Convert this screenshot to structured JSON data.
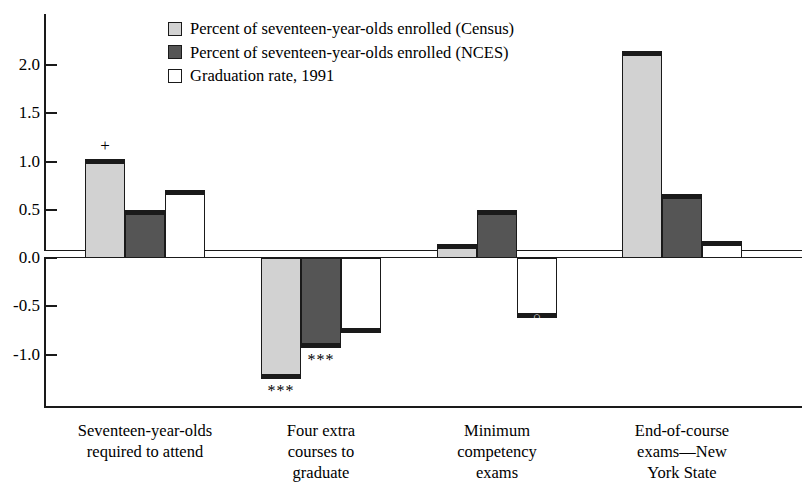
{
  "chart_data": {
    "type": "bar",
    "title": "",
    "xlabel": "",
    "ylabel": "",
    "ylim": [
      -1.45,
      2.35
    ],
    "yticks": [
      "2.0",
      "1.5",
      "1.0",
      "0.5",
      "0.0",
      "-0.5",
      "-1.0"
    ],
    "ytick_values": [
      2.0,
      1.5,
      1.0,
      0.5,
      0.0,
      -0.5,
      -1.0
    ],
    "grid": false,
    "legend_position": "top-center",
    "categories": [
      "Seventeen-year-olds\nrequired to attend",
      "Four extra\ncourses to\ngraduate",
      "Minimum\ncompetency\nexams",
      "End-of-course\nexams—New\nYork State"
    ],
    "series": [
      {
        "name": "Percent of seventeen-year-olds enrolled (Census)",
        "swatch": "light",
        "values": [
          1.03,
          -1.25,
          0.15,
          2.15
        ],
        "markers": [
          "+",
          "***",
          "",
          ""
        ]
      },
      {
        "name": "Percent of seventeen-year-olds enrolled (NCES)",
        "swatch": "dark",
        "values": [
          0.5,
          -0.93,
          0.5,
          0.66
        ],
        "markers": [
          "",
          "***",
          "",
          ""
        ]
      },
      {
        "name": "Graduation rate, 1991",
        "swatch": "white",
        "values": [
          0.7,
          -0.78,
          -0.62,
          0.18
        ],
        "markers": [
          "",
          "",
          "o",
          ""
        ]
      }
    ],
    "baseline_band": 0.08
  },
  "legend": {
    "items": [
      {
        "label": "Percent of seventeen-year-olds enrolled (Census)",
        "swatch": "light"
      },
      {
        "label": "Percent of seventeen-year-olds enrolled (NCES)",
        "swatch": "dark"
      },
      {
        "label": "Graduation rate, 1991",
        "swatch": "white"
      }
    ]
  },
  "colors": {
    "light": "#d2d2d2",
    "dark": "#555555",
    "white": "#ffffff",
    "axis": "#1a1a1a"
  }
}
